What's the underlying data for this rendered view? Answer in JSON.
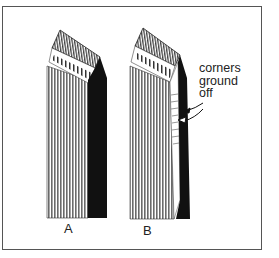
{
  "figure": {
    "labels": {
      "a": "A",
      "b": "B"
    },
    "annotation": {
      "lines": [
        "corners",
        "ground",
        "off"
      ]
    },
    "colors": {
      "frame": "#555555",
      "ink": "#111111",
      "hatch": "#777777",
      "background": "#ffffff"
    }
  }
}
